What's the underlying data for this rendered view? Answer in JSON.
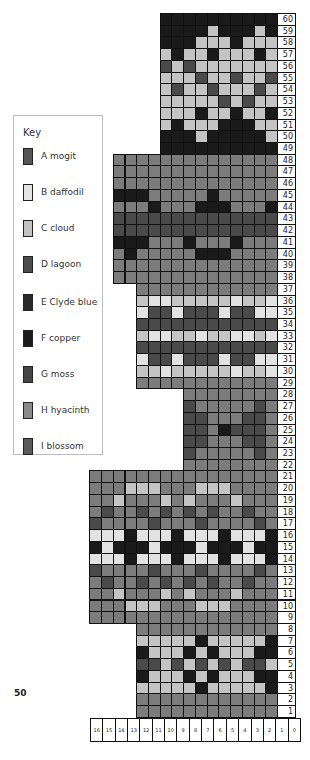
{
  "page_number": "50",
  "legend": {
    "title": "Key",
    "items": [
      {
        "code": "A",
        "label": "A mogit",
        "color": "#555555"
      },
      {
        "code": "B",
        "label": "B daffodil",
        "color": "#e4e4e4"
      },
      {
        "code": "C",
        "label": "C cloud",
        "color": "#c2c2c2"
      },
      {
        "code": "D",
        "label": "D lagoon",
        "color": "#4c4c4c"
      },
      {
        "code": "E",
        "label": "E Clyde blue",
        "color": "#2a2a2a"
      },
      {
        "code": "F",
        "label": "F copper",
        "color": "#1c1c1c"
      },
      {
        "code": "G",
        "label": "G moss",
        "color": "#454545"
      },
      {
        "code": "H",
        "label": "H hyacinth",
        "color": "#8a8a8a"
      },
      {
        "code": "I",
        "label": "I blossom",
        "color": "#5a5a5a"
      }
    ]
  },
  "palette": {
    "K": "#1a1a1a",
    "L": "#c4c4c4",
    "B": "#e2e2e2",
    "G": "#7c7c7c",
    "D": "#4a4a4a"
  },
  "chart_data": {
    "type": "heatmap",
    "xlabel": "Stitch",
    "ylabel": "Row",
    "column_labels": [
      "16",
      "15",
      "14",
      "13",
      "12",
      "11",
      "10",
      "9",
      "8",
      "7",
      "6",
      "5",
      "4",
      "3",
      "2",
      "1",
      "0"
    ],
    "row_range": [
      1,
      60
    ],
    "note": "Rows listed top (60) to bottom (1); each row string reads left to right, right-aligned to stitch 1. K=black, L=light grey, B=near-white, G=mid grey, D=dark grey.",
    "rows": {
      "60": "KKKKKKKKKK",
      "59": "KKKKLKKKLK",
      "58": "KKKLLLKLLL",
      "57": "LKLLKLLLKL",
      "56": "DLDLLLLLLL",
      "55": "LLLDLLDLLD",
      "54": "LDLLDLLLDL",
      "53": "LLLLLDLDLL",
      "52": "LLLKLLKLLK",
      "51": "LKLLLKKKLL",
      "50": "KKKLKKKKKL",
      "49": "KKKKKKKKKK",
      "48": "GGGGGGGGGGGGGG",
      "47": "GGGGGGGGGGGGGG",
      "46": "GGGGGGGGGGGGGG",
      "45": "KKKGGGGGKGGGGG",
      "44": "GGGKGGGKKKGGGK",
      "43": "DDDDDDDDDDDDDD",
      "42": "DDDDDDDDDDDDDD",
      "41": "KKKGGGKGGGKGGG",
      "40": "GKGGGGGKKKGGGG",
      "39": "GGGGGGGGGGGGGG",
      "38": "GGGGGGGGGGGGGG",
      "37": "GGGGGGGGGGGG",
      "36": "LBBLLLLLBLLB",
      "35": "BDDBDDDBDDBB",
      "34": "DDDDDDDDDDDD",
      "33": "LBBLLBLLBBLB",
      "32": "DDDDDDDDDDDD",
      "31": "BDDBDDDBDDBB",
      "30": "LLBLLLLLBLLB",
      "29": "GGGGGGGGGGGG",
      "28": "GGGGGGGG",
      "27": "DGGGGGDG",
      "26": "DDGGGDDG",
      "25": "DDGKDDDG",
      "24": "DDGGGDDG",
      "23": "DGGGGGDG",
      "22": "GGGGGGGG",
      "21": "GGGGGGGGGGGGGGGG",
      "20": "GGGLLLGGGLLLGGGG",
      "19": "GGLGGGLGLGGGLGGG",
      "18": "GDGGDGDGDGDGGDGG",
      "17": "DGGGGDGGGDGGGGDG",
      "16": "BBBKBBBKBBBKBBBK",
      "15": "KBKKKBKKKBKKKBKK",
      "14": "BBBKBBBKBBBKBBBK",
      "13": "DGGGGDGGGDGGGGDG",
      "12": "GDGGDGDGDGDGGDGG",
      "11": "GGLGGGLGLGGGLGGG",
      "10": "GGGLLLGGGLLLGGGG",
      "9": "GGGGGGGGGGGGGGGG",
      "8": "GGGGGGGGGGGG",
      "7": "LLLLLKLLLLLK",
      "6": "KLLLKLKLLLKK",
      "5": "DDLDLDLDLDDL",
      "4": "KLLLKLKLLLKK",
      "3": "LLLLLKLLLLLK",
      "2": "GGGGGGGGGGGG",
      "1": "GGGGGGGGGGGG"
    }
  }
}
